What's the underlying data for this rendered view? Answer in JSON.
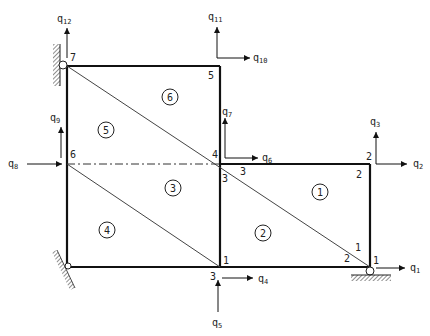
{
  "diagram": {
    "nodes": [
      {
        "id": "7",
        "label": "7"
      },
      {
        "id": "5",
        "label": "5"
      },
      {
        "id": "6",
        "label": "6"
      },
      {
        "id": "4",
        "label": "4"
      },
      {
        "id": "2",
        "label": "2"
      },
      {
        "id": "1",
        "label": "1"
      },
      {
        "id": "3",
        "label": "3"
      }
    ],
    "elements": [
      {
        "id": "1",
        "label": "1"
      },
      {
        "id": "2",
        "label": "2"
      },
      {
        "id": "3",
        "label": "3"
      },
      {
        "id": "4",
        "label": "4"
      },
      {
        "id": "5",
        "label": "5"
      },
      {
        "id": "6",
        "label": "6"
      }
    ],
    "local_labels": {
      "n3_at4_right": "3",
      "n3_at4_below": "3",
      "n2_inside": "2",
      "n1_corner_top": "1",
      "n2_corner_left": "2",
      "n1_at3": "1",
      "n1_right": "1"
    },
    "dofs": {
      "q1": {
        "base": "q",
        "sub": "1"
      },
      "q2": {
        "base": "q",
        "sub": "2"
      },
      "q3": {
        "base": "q",
        "sub": "3"
      },
      "q4": {
        "base": "q",
        "sub": "4"
      },
      "q5": {
        "base": "q",
        "sub": "5"
      },
      "q6": {
        "base": "q",
        "sub": "6"
      },
      "q7": {
        "base": "q",
        "sub": "7"
      },
      "q8": {
        "base": "q",
        "sub": "8"
      },
      "q9": {
        "base": "q",
        "sub": "9"
      },
      "q10": {
        "base": "q",
        "sub": "10"
      },
      "q11": {
        "base": "q",
        "sub": "11"
      },
      "q12": {
        "base": "q",
        "sub": "12"
      }
    }
  }
}
